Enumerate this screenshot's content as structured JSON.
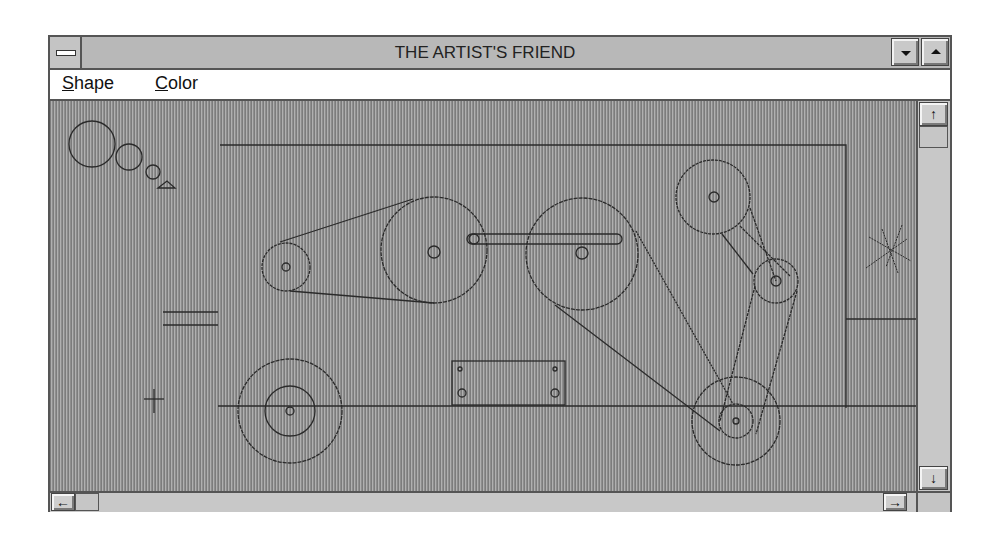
{
  "window": {
    "title": "THE ARTIST'S FRIEND",
    "system_menu_icon": "system-menu-icon",
    "minimize_icon": "triangle-down",
    "maximize_icon": "triangle-up"
  },
  "menubar": {
    "items": [
      {
        "label_underlined": "S",
        "label_rest": "hape",
        "label": "Shape"
      },
      {
        "label_underlined": "C",
        "label_rest": "olor",
        "label": "Color"
      }
    ]
  },
  "scrollbars": {
    "vertical": {
      "up_arrow": "↑",
      "down_arrow": "↓",
      "thumb_position": "top"
    },
    "horizontal": {
      "left_arrow": "←",
      "right_arrow": "→",
      "thumb_position": "left"
    }
  },
  "canvas": {
    "background": "vertical-line hatch gray",
    "drawing": "mechanical belt-and-pulley diagram",
    "stroke_color": "#2a2a2a"
  }
}
